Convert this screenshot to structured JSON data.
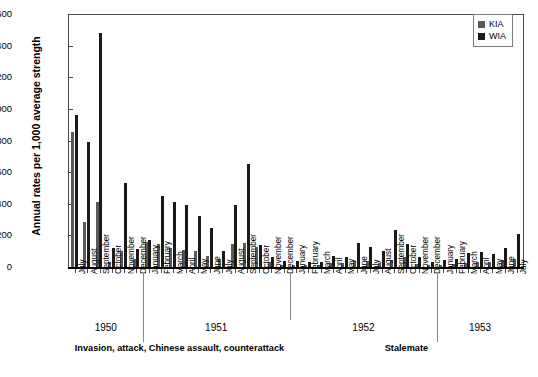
{
  "chart_data": {
    "type": "bar",
    "title": "",
    "xlabel": "",
    "ylabel": "Annual rates per 1,000 average strength",
    "ylim": [
      0,
      1600
    ],
    "yticks": [
      0,
      200,
      400,
      600,
      800,
      1000,
      1200,
      1400,
      1600
    ],
    "ytick_labels": [
      "0",
      "200",
      "400",
      "600",
      "800",
      "1,000",
      "1,200",
      "1,400",
      "1,600"
    ],
    "grid": false,
    "legend_position": "top-right",
    "legend": [
      "KIA",
      "WIA"
    ],
    "categories": [
      "July",
      "August",
      "September",
      "October",
      "November",
      "December",
      "January",
      "February",
      "March",
      "April",
      "May",
      "June",
      "July",
      "August",
      "September",
      "October",
      "November",
      "December",
      "January",
      "February",
      "March",
      "April",
      "May",
      "June",
      "July",
      "August",
      "September",
      "October",
      "November",
      "December",
      "January",
      "February",
      "March",
      "April",
      "May",
      "June",
      "July"
    ],
    "series": [
      {
        "name": "KIA",
        "color": "#595959",
        "values": [
          860,
          290,
          415,
          35,
          110,
          55,
          165,
          150,
          125,
          115,
          110,
          75,
          60,
          150,
          160,
          135,
          35,
          20,
          22,
          18,
          20,
          30,
          30,
          45,
          45,
          30,
          48,
          70,
          25,
          18,
          22,
          25,
          30,
          35,
          38,
          50,
          60
        ]
      },
      {
        "name": "WIA",
        "color": "#1a1a1a",
        "values": [
          970,
          800,
          1485,
          125,
          535,
          120,
          180,
          455,
          415,
          400,
          330,
          250,
          110,
          400,
          655,
          145,
          70,
          45,
          42,
          35,
          40,
          75,
          70,
          160,
          130,
          105,
          240,
          155,
          70,
          40,
          50,
          60,
          95,
          100,
          90,
          125,
          215
        ]
      }
    ],
    "periods": [
      {
        "year": "1950",
        "phase": "Invasion, attack, Chinese assault, counterattack",
        "months": 6
      },
      {
        "year": "1951",
        "phase": "",
        "months": 12
      },
      {
        "year": "1952",
        "phase": "Stalemate",
        "months": 12
      },
      {
        "year": "1953",
        "phase": "",
        "months": 7
      }
    ]
  },
  "legend": {
    "items": [
      {
        "label": "KIA",
        "color": "#595959"
      },
      {
        "label": "WIA",
        "color": "#1a1a1a"
      }
    ]
  },
  "axis": {
    "y_title": "Annual rates per 1,000 average strength"
  },
  "year_labels": [
    "1950",
    "1951",
    "1952",
    "1953"
  ],
  "phase_labels": {
    "invasion": "Invasion, attack, Chinese assault, counterattack",
    "stalemate": "Stalemate"
  }
}
